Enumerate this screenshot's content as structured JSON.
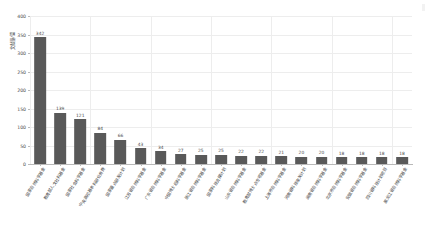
{
  "chart_data": {
    "type": "bar",
    "title": "",
    "subtitle": "",
    "xlabel": "",
    "ylabel": "文献量/篇",
    "ylim": [
      0,
      400
    ],
    "ytick_values": [
      0,
      50,
      100,
      150,
      200,
      250,
      300,
      350,
      400
    ],
    "ytick_labels": [
      "0",
      "50",
      "100",
      "150",
      "200",
      "250",
      "300",
      "350",
      "400"
    ],
    "grid": true,
    "legend": false,
    "legend_position": "none",
    "bar_color": "#595959",
    "grid_color": "#ededed",
    "axis_color": "#b9b9b9",
    "label_rotation": -58,
    "categories": [
      "国家自然科学基金",
      "教育部人文社科基金",
      "国家社会科学基金",
      "中央高校基本科研业务费",
      "国家重点研发计划",
      "江苏省自然科学基金",
      "广东省自然科学基金",
      "中国博士后科学基金",
      "浙江省自然科学基金",
      "国家科技支撑计划",
      "山东省自然科学基金",
      "教育部博士点专项基金",
      "上海市自然科学基金",
      "河南省科技攻关计划",
      "湖南省自然科学基金",
      "北京市自然科学基金",
      "安徽省自然科学基金",
      "四川省科技计划项目",
      "黑龙江省自然科学基金"
    ],
    "values": [
      342,
      139,
      121,
      84,
      66,
      43,
      34,
      27,
      25,
      25,
      22,
      22,
      21,
      20,
      20,
      18,
      18,
      18,
      18
    ]
  }
}
